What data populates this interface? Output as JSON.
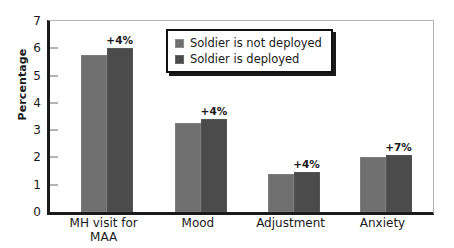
{
  "chart_data": {
    "type": "bar",
    "title": "",
    "subtitle": "",
    "xlabel": "",
    "ylabel": "Percentage",
    "ylim": [
      0,
      7
    ],
    "yticks": [
      0,
      1,
      2,
      3,
      4,
      5,
      6,
      7
    ],
    "ytick_labels": [
      "0",
      "1",
      "2",
      "3",
      "4",
      "5",
      "6",
      "7"
    ],
    "grid": false,
    "legend_position": "top-center",
    "categories": [
      "MH visit for\nMAA",
      "Mood",
      "Adjustment",
      "Anxiety"
    ],
    "series": [
      {
        "name": "Soldier is not deployed",
        "color": "#6f6f6f",
        "values": [
          5.75,
          3.25,
          1.4,
          2.0
        ]
      },
      {
        "name": "Soldier is deployed",
        "color": "#4b4b4b",
        "values": [
          6.0,
          3.4,
          1.45,
          2.1
        ]
      }
    ],
    "annotations": [
      "+4%",
      "+4%",
      "+4%",
      "+7%"
    ]
  },
  "legend": {
    "items": [
      {
        "label": "Soldier is not deployed"
      },
      {
        "label": "Soldier is deployed"
      }
    ]
  },
  "colors": {
    "series_light": "#6f6f6f",
    "series_dark": "#4b4b4b",
    "axis": "#1a1a1a",
    "frame": "#b4b4b4",
    "background": "#ffffff"
  }
}
